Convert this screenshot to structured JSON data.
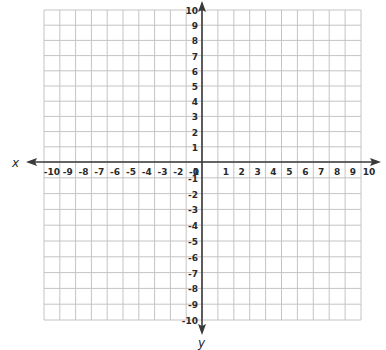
{
  "chart_data": {
    "type": "scatter",
    "title": "",
    "subtitle": "",
    "xlabel": "x",
    "ylabel": "y",
    "xlim": [
      -10,
      10
    ],
    "ylim": [
      -10,
      10
    ],
    "grid": true,
    "x_ticks": [
      -10,
      -9,
      -8,
      -7,
      -6,
      -5,
      -4,
      -3,
      -2,
      -1,
      0,
      1,
      2,
      3,
      4,
      5,
      6,
      7,
      8,
      9,
      10
    ],
    "y_ticks": [
      -10,
      -9,
      -8,
      -7,
      -6,
      -5,
      -4,
      -3,
      -2,
      -1,
      1,
      2,
      3,
      4,
      5,
      6,
      7,
      8,
      9,
      10
    ],
    "series": [],
    "legend": null
  },
  "colors": {
    "grid": "#c4c4c4",
    "axis": "#3a3a3a",
    "text": "#2a2a2a",
    "background": "#ffffff"
  }
}
